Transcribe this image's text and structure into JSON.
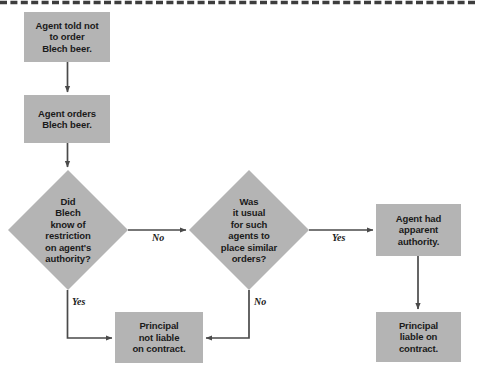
{
  "figure": {
    "type": "flowchart",
    "background_color": "#ffffff",
    "node_fill_color": "#b4b4b4",
    "node_text_color": "#1a1a1a",
    "connector_color": "#4a4a4a",
    "top_rule_style": "dashed"
  },
  "nodes": {
    "agent_told": {
      "shape": "rectangle",
      "text": "Agent told not\nto order\nBlech beer."
    },
    "agent_orders": {
      "shape": "rectangle",
      "text": "Agent orders\nBlech beer."
    },
    "decision_knew": {
      "shape": "diamond",
      "text": "Did\nBlech\nknow of\nrestriction\non agent's\nauthority?"
    },
    "decision_usual": {
      "shape": "diamond",
      "text": "Was\nit usual\nfor such\nagents to\nplace similar\norders?"
    },
    "apparent_authority": {
      "shape": "rectangle",
      "text": "Agent had\napparent\nauthority."
    },
    "principal_liable": {
      "shape": "rectangle",
      "text": "Principal\nliable on\ncontract."
    },
    "principal_not_liable": {
      "shape": "rectangle",
      "text": "Principal\nnot liable\non contract."
    }
  },
  "edges": {
    "knew_no": {
      "label": "No"
    },
    "knew_yes": {
      "label": "Yes"
    },
    "usual_yes": {
      "label": "Yes"
    },
    "usual_no": {
      "label": "No"
    }
  }
}
